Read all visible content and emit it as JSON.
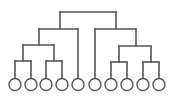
{
  "diagram": {
    "type": "binary-tree-dendrogram",
    "stroke_color": "#555555",
    "fill_color": "#ffffff",
    "leaf_radius": 6,
    "leaf_y": 84.5,
    "leaves": [
      {
        "id": "leaf-1",
        "x": 15
      },
      {
        "id": "leaf-2",
        "x": 31
      },
      {
        "id": "leaf-3",
        "x": 46
      },
      {
        "id": "leaf-4",
        "x": 62
      },
      {
        "id": "leaf-5",
        "x": 78
      },
      {
        "id": "leaf-6",
        "x": 95
      },
      {
        "id": "leaf-7",
        "x": 111
      },
      {
        "id": "leaf-8",
        "x": 127
      },
      {
        "id": "leaf-9",
        "x": 143
      },
      {
        "id": "leaf-10",
        "x": 159
      }
    ],
    "internal_nodes": [
      {
        "id": "root",
        "y": 12,
        "x1": 60,
        "x2": 116,
        "stem_x": 88,
        "has_stem": false
      },
      {
        "id": "left-1",
        "y": 29,
        "x1": 39,
        "x2": 78,
        "stem_x": 60,
        "parent_y": 12
      },
      {
        "id": "right-1",
        "y": 29,
        "x1": 95,
        "x2": 136,
        "stem_x": 116,
        "parent_y": 12
      },
      {
        "id": "left-2",
        "y": 45,
        "x1": 23,
        "x2": 54,
        "stem_x": 39,
        "parent_y": 29
      },
      {
        "id": "right-2",
        "y": 46,
        "x1": 119,
        "x2": 151,
        "stem_x": 136,
        "parent_y": 29
      },
      {
        "id": "left-3a",
        "y": 61,
        "x1": 15,
        "x2": 31,
        "stem_x": 23,
        "parent_y": 45
      },
      {
        "id": "left-3b",
        "y": 61,
        "x1": 46,
        "x2": 62,
        "stem_x": 54,
        "parent_y": 45
      },
      {
        "id": "right-3a",
        "y": 62,
        "x1": 111,
        "x2": 127,
        "stem_x": 119,
        "parent_y": 46
      },
      {
        "id": "right-3b",
        "y": 62,
        "x1": 143,
        "x2": 159,
        "stem_x": 151,
        "parent_y": 46
      }
    ],
    "leaf_edges": [
      {
        "leaf": "leaf-1",
        "x": 15,
        "from_y": 61
      },
      {
        "leaf": "leaf-2",
        "x": 31,
        "from_y": 61
      },
      {
        "leaf": "leaf-3",
        "x": 46,
        "from_y": 61
      },
      {
        "leaf": "leaf-4",
        "x": 62,
        "from_y": 61
      },
      {
        "leaf": "leaf-5",
        "x": 78,
        "from_y": 29
      },
      {
        "leaf": "leaf-6",
        "x": 95,
        "from_y": 29
      },
      {
        "leaf": "leaf-7",
        "x": 111,
        "from_y": 62
      },
      {
        "leaf": "leaf-8",
        "x": 127,
        "from_y": 62
      },
      {
        "leaf": "leaf-9",
        "x": 143,
        "from_y": 62
      },
      {
        "leaf": "leaf-10",
        "x": 159,
        "from_y": 62
      }
    ]
  }
}
